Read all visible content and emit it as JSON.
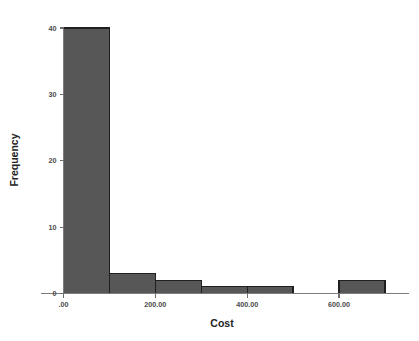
{
  "chart_data": {
    "type": "bar",
    "title": "",
    "subtitle": "",
    "xlabel": "Cost",
    "ylabel": "Frequency",
    "bin_width": 100,
    "bin_edges": [
      0,
      100,
      200,
      300,
      400,
      500,
      600,
      700
    ],
    "categories": [
      "0-100",
      "100-200",
      "200-300",
      "300-400",
      "400-500",
      "500-600",
      "600-700"
    ],
    "values": [
      40,
      3,
      2,
      1,
      1,
      0,
      2
    ],
    "xlim": [
      -50,
      760
    ],
    "ylim": [
      0,
      42
    ],
    "x_ticks": [
      0,
      200,
      400,
      600
    ],
    "x_tick_labels": [
      ".00",
      "200.00",
      "400.00",
      "600.00"
    ],
    "y_ticks": [
      0,
      10,
      20,
      30,
      40
    ],
    "y_tick_labels": [
      "0",
      "10",
      "20",
      "30",
      "40"
    ],
    "grid": false,
    "legend": "none",
    "bar_fill_color": "#575757",
    "bar_edge_color": "#1f1f1f",
    "axis_color": "#7d7d7d",
    "background_color": "#ffffff"
  },
  "axes": {
    "x_title": "Cost",
    "y_title": "Frequency"
  }
}
